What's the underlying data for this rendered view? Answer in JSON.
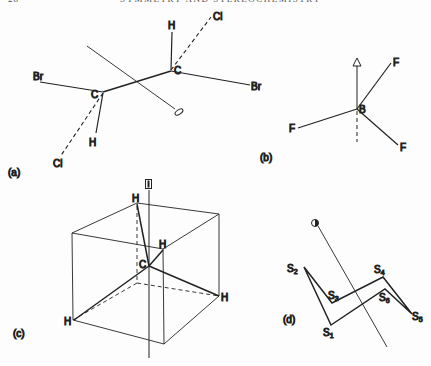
{
  "header": {
    "page_number": "28",
    "running_title": "SYMMETRY AND STEREOCHEMISTRY"
  },
  "figure": {
    "panels": [
      {
        "id": "a",
        "label": "(a)",
        "atoms": {
          "c_left": "C",
          "c_right": "C",
          "br_left": "Br",
          "br_right": "Br",
          "cl_top": "Cl",
          "cl_bottom": "Cl",
          "h_top": "H",
          "h_bottom": "H"
        },
        "axis_symbol": "ellipse (C2 axis)"
      },
      {
        "id": "b",
        "label": "(b)",
        "atoms": {
          "center": "B",
          "f_upper": "F",
          "f_left": "F",
          "f_lower": "F"
        },
        "axis_symbol": "triangle (C3 axis)"
      },
      {
        "id": "c",
        "label": "(c)",
        "atoms": {
          "center": "C",
          "h_top": "H",
          "h_front": "H",
          "h_left": "H",
          "h_right": "H"
        },
        "axis_symbol": "square with bar (S4 axis)"
      },
      {
        "id": "d",
        "label": "(d)",
        "atoms": [
          {
            "el": "S",
            "sub": "1"
          },
          {
            "el": "S",
            "sub": "2"
          },
          {
            "el": "S",
            "sub": "3"
          },
          {
            "el": "S",
            "sub": "4"
          },
          {
            "el": "S",
            "sub": "5"
          },
          {
            "el": "S",
            "sub": "6"
          }
        ],
        "axis_symbol": "filled circle (S6 axis)"
      }
    ]
  },
  "colors": {
    "ink": "#222222",
    "paper": "#fdfdfd"
  }
}
